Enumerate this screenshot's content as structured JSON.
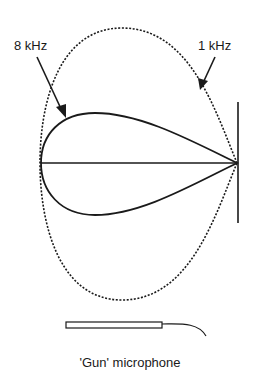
{
  "diagram": {
    "type": "polar-pickup-pattern",
    "labels": {
      "high_freq": "8 kHz",
      "low_freq": "1 kHz",
      "caption": "'Gun' microphone"
    },
    "series": [
      {
        "name": "8 kHz",
        "line_style": "solid",
        "shape": "narrow teardrop lobe"
      },
      {
        "name": "1 kHz",
        "line_style": "dashed",
        "shape": "wide teardrop lobe"
      }
    ],
    "colors": {
      "ink": "#1a1a1a",
      "background": "#ffffff"
    }
  }
}
